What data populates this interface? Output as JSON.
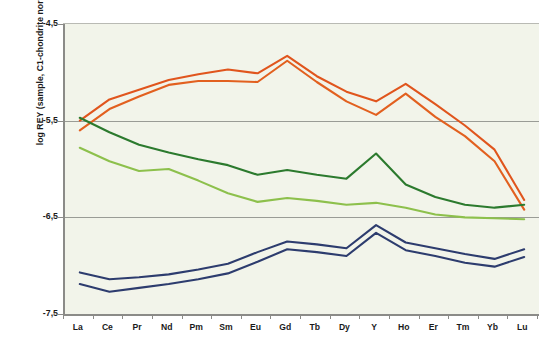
{
  "chart_data": {
    "type": "line",
    "title": "",
    "xlabel": "",
    "ylabel": "log REY (sample, C1-chondrite normalised)",
    "categories": [
      "La",
      "Ce",
      "Pr",
      "Nd",
      "Pm",
      "Sm",
      "Eu",
      "Gd",
      "Tb",
      "Dy",
      "Y",
      "Ho",
      "Er",
      "Tm",
      "Yb",
      "Lu"
    ],
    "ylim": [
      -7.5,
      -4.5
    ],
    "ytick_labels": [
      "-4,5",
      "-5,5",
      "-6,5",
      "-7,5"
    ],
    "ytick_values": [
      -4.5,
      -5.5,
      -6.5,
      -7.5
    ],
    "grid": "horizontal",
    "legend": "none",
    "series": [
      {
        "name": "orange-upper",
        "color": "#E0551D",
        "values": [
          -5.5,
          -5.28,
          -5.18,
          -5.08,
          -5.02,
          -4.97,
          -5.01,
          -4.83,
          -5.04,
          -5.2,
          -5.3,
          -5.12,
          -5.33,
          -5.55,
          -5.8,
          -6.32
        ]
      },
      {
        "name": "orange-lower",
        "color": "#E2601F",
        "values": [
          -5.6,
          -5.38,
          -5.25,
          -5.13,
          -5.09,
          -5.09,
          -5.1,
          -4.88,
          -5.1,
          -5.3,
          -5.44,
          -5.22,
          -5.46,
          -5.66,
          -5.92,
          -6.42
        ]
      },
      {
        "name": "dark-green",
        "color": "#2C7A2E",
        "values": [
          -5.47,
          -5.62,
          -5.75,
          -5.83,
          -5.9,
          -5.96,
          -6.06,
          -6.01,
          -6.06,
          -6.1,
          -5.84,
          -6.16,
          -6.29,
          -6.37,
          -6.4,
          -6.37
        ]
      },
      {
        "name": "light-green",
        "color": "#8DC04C",
        "values": [
          -5.78,
          -5.92,
          -6.02,
          -6.0,
          -6.12,
          -6.25,
          -6.34,
          -6.3,
          -6.33,
          -6.37,
          -6.35,
          -6.4,
          -6.47,
          -6.5,
          -6.51,
          -6.52
        ]
      },
      {
        "name": "blue-upper",
        "color": "#2D3C6E",
        "values": [
          -7.07,
          -7.14,
          -7.12,
          -7.09,
          -7.04,
          -6.98,
          -6.86,
          -6.75,
          -6.78,
          -6.82,
          -6.58,
          -6.76,
          -6.82,
          -6.88,
          -6.93,
          -6.83
        ]
      },
      {
        "name": "blue-lower",
        "color": "#2D3C6E",
        "values": [
          -7.19,
          -7.27,
          -7.23,
          -7.19,
          -7.14,
          -7.08,
          -6.96,
          -6.83,
          -6.86,
          -6.9,
          -6.66,
          -6.84,
          -6.9,
          -6.97,
          -7.01,
          -6.91
        ]
      }
    ]
  },
  "plot": {
    "background": "#f2f4ea",
    "axis_color": "#8b8b88",
    "grid_color": "#9a9c96"
  }
}
